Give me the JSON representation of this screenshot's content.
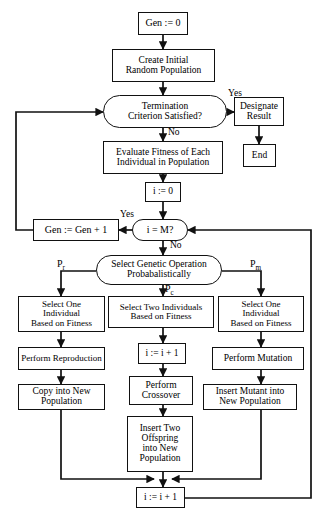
{
  "diagram": {
    "stroke_color": "#111111",
    "background_color": "#ffffff",
    "text_color": "#000000"
  },
  "nodes": {
    "gen_init": {
      "label": "Gen := 0",
      "shape": "rect"
    },
    "create_population": {
      "label": "Create Initial\nRandom Population",
      "shape": "rect"
    },
    "termination": {
      "label": "Termination\nCriterion Satisfied?",
      "shape": "oval"
    },
    "designate_result": {
      "label": "Designate\nResult",
      "shape": "rect"
    },
    "end": {
      "label": "End",
      "shape": "rect"
    },
    "evaluate_fitness": {
      "label": "Evaluate Fitness of Each\nIndividual in Population",
      "shape": "rect"
    },
    "i_init": {
      "label": "i := 0",
      "shape": "rect"
    },
    "gen_increment": {
      "label": "Gen := Gen + 1",
      "shape": "rect"
    },
    "i_equals_m": {
      "label": "i = M?",
      "shape": "oval"
    },
    "select_operation": {
      "label": "Select Genetic Operation\nProbabalistically",
      "shape": "oval"
    },
    "select_one_left": {
      "label": "Select One\nIndividual\nBased on Fitness",
      "shape": "rect"
    },
    "select_two_middle": {
      "label": "Select Two Individuals\nBased on Fitness",
      "shape": "rect"
    },
    "select_one_right": {
      "label": "Select One\nIndividual\nBased on Fitness",
      "shape": "rect"
    },
    "perform_reproduction": {
      "label": "Perform Reproduction",
      "shape": "rect"
    },
    "i_increment_middle": {
      "label": "i := i + 1",
      "shape": "rect"
    },
    "perform_mutation": {
      "label": "Perform Mutation",
      "shape": "rect"
    },
    "copy_into_population": {
      "label": "Copy into New\nPopulation",
      "shape": "rect"
    },
    "perform_crossover": {
      "label": "Perform\nCrossover",
      "shape": "rect"
    },
    "insert_mutant": {
      "label": "Insert Mutant into\nNew Population",
      "shape": "rect"
    },
    "insert_offspring": {
      "label": "Insert Two\nOffspring\ninto New\nPopulation",
      "shape": "rect"
    },
    "i_increment_bottom": {
      "label": "i := i + 1",
      "shape": "rect"
    }
  },
  "edge_labels": {
    "termination_yes": "Yes",
    "termination_no": "No",
    "i_equals_m_yes": "Yes",
    "i_equals_m_no": "No",
    "prob_reproduction": "P",
    "prob_reproduction_sub": "r",
    "prob_crossover": "P",
    "prob_crossover_sub": "c",
    "prob_mutation": "P",
    "prob_mutation_sub": "m"
  }
}
